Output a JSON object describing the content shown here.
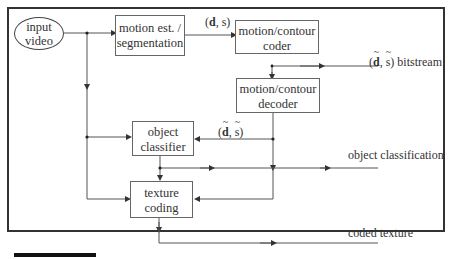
{
  "diagram": {
    "nodes": {
      "input": {
        "line1": "input",
        "line2": "video"
      },
      "motion_est": {
        "line1": "motion est. /",
        "line2": "segmentation"
      },
      "mc_coder": {
        "line1": "motion/contour",
        "line2": "coder"
      },
      "mc_decoder": {
        "line1": "motion/contour",
        "line2": "decoder"
      },
      "obj_class": {
        "line1": "object",
        "line2": "classifier"
      },
      "tex_coding": {
        "line1": "texture",
        "line2": "coding"
      }
    },
    "labels": {
      "ds_open": "(",
      "ds_d": "d",
      "ds_rest": ", s)",
      "tilde_d": "d",
      "tilde_s": "s",
      "comma": ", ",
      "open": "(",
      "close": ")",
      "bitstream": " bitstream",
      "object_classification": "object classification",
      "coded_texture": "coded texture"
    },
    "edges": [
      {
        "from": "input",
        "to": "motion_est"
      },
      {
        "from": "input",
        "to": "obj_class"
      },
      {
        "from": "input",
        "to": "tex_coding"
      },
      {
        "from": "motion_est",
        "to": "mc_coder",
        "label": "(d, s)"
      },
      {
        "from": "mc_coder",
        "to": "bitstream",
        "label": "(d~, s~) bitstream"
      },
      {
        "from": "bitstream",
        "to": "mc_decoder"
      },
      {
        "from": "mc_decoder",
        "to": "obj_class",
        "label": "(d~, s~)"
      },
      {
        "from": "mc_decoder",
        "to": "tex_coding"
      },
      {
        "from": "obj_class",
        "to": "tex_coding"
      },
      {
        "from": "obj_class",
        "to": "output",
        "label": "object classification"
      },
      {
        "from": "tex_coding",
        "to": "output",
        "label": "coded texture"
      }
    ]
  }
}
